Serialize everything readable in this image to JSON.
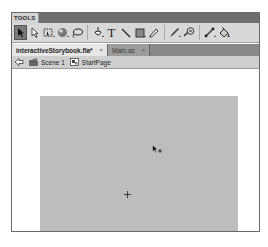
{
  "tools_panel": {
    "title": "TOOLS",
    "tools": [
      {
        "name": "selection-tool",
        "glyph": "arrow",
        "active": true
      },
      {
        "name": "subselection-tool",
        "glyph": "hollow-arrow"
      },
      {
        "name": "free-transform-tool",
        "glyph": "transform",
        "has_submenu": true
      },
      {
        "name": "3d-rotation-tool",
        "glyph": "sphere",
        "has_submenu": true
      },
      {
        "name": "lasso-tool",
        "glyph": "lasso"
      },
      {
        "name": "pen-tool",
        "glyph": "pen",
        "has_submenu": true
      },
      {
        "name": "text-tool",
        "glyph": "T"
      },
      {
        "name": "line-tool",
        "glyph": "line"
      },
      {
        "name": "rectangle-tool",
        "glyph": "rect",
        "has_submenu": true
      },
      {
        "name": "pencil-tool",
        "glyph": "pencil"
      },
      {
        "name": "brush-tool",
        "glyph": "brush",
        "has_submenu": true
      },
      {
        "name": "deco-tool",
        "glyph": "deco"
      },
      {
        "name": "bone-tool",
        "glyph": "bone",
        "has_submenu": true
      },
      {
        "name": "paint-bucket-tool",
        "glyph": "bucket",
        "has_submenu": true
      }
    ],
    "submenu_marker": "▪"
  },
  "tabs": [
    {
      "label": "interactiveStorybook.fla*",
      "active": true,
      "close": "×"
    },
    {
      "label": "Main.as",
      "active": false,
      "close": "×"
    }
  ],
  "edit_bar": {
    "back_icon": "back-arrow-icon",
    "breadcrumbs": [
      {
        "label": "Scene 1",
        "icon": "scene-clapper-icon"
      },
      {
        "label": "StartPage",
        "icon": "movieclip-symbol-icon"
      }
    ]
  },
  "stage": {
    "background_color": "#c4c4c4",
    "cursor": "selection-arrow-move-cursor",
    "registration_point": "+"
  },
  "colors": {
    "panel_header": "#6e6e6e",
    "toolbar_bg": "#d8d8d8",
    "tabbar_bg": "#888888",
    "active_tab": "#e6e6e6",
    "editbar_bg": "#cfcfcf"
  }
}
